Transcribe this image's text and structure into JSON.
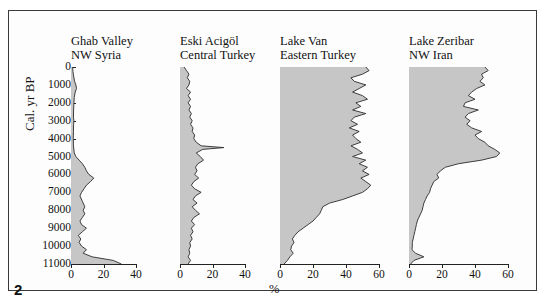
{
  "figure": {
    "number": "2",
    "yaxis_label": "Cal. yr BP",
    "xaxis_label": "%"
  },
  "chart_data": {
    "type": "area",
    "title": "",
    "xlabel": "%",
    "ylabel": "Cal. yr BP",
    "ylim": [
      0,
      11000
    ],
    "y_inverted": true,
    "grid": false,
    "legend": "none",
    "y_ticks": [
      0,
      1000,
      2000,
      3000,
      4000,
      5000,
      6000,
      7000,
      8000,
      9000,
      10000,
      11000
    ],
    "panels": [
      {
        "name": "Ghab Valley",
        "title_line1": "Ghab Valley",
        "title_line2": "NW Syria",
        "xlim": [
          0,
          40
        ],
        "x_ticks": [
          0,
          20,
          40
        ],
        "x_tick_labels": [
          "0",
          "20",
          "40"
        ],
        "y": [
          0,
          250,
          500,
          800,
          1000,
          1200,
          1400,
          1700,
          2000,
          2400,
          2800,
          3000,
          3200,
          3600,
          4000,
          4400,
          4800,
          5000,
          5200,
          5400,
          5600,
          5800,
          6000,
          6200,
          6400,
          6600,
          6800,
          7000,
          7200,
          7500,
          7800,
          8000,
          8200,
          8400,
          8600,
          8800,
          9000,
          9200,
          9400,
          9600,
          9800,
          10000,
          10200,
          10400,
          10600,
          10800,
          11000
        ],
        "values": [
          1.0,
          1.2,
          1.6,
          2.2,
          3.0,
          3.4,
          2.6,
          2.0,
          1.8,
          1.6,
          1.5,
          1.8,
          1.6,
          1.5,
          1.4,
          1.5,
          2.0,
          3.0,
          5.0,
          7.0,
          8.5,
          9.5,
          11.0,
          14.0,
          12.0,
          9.5,
          8.0,
          6.5,
          5.5,
          7.0,
          8.5,
          7.5,
          8.5,
          7.0,
          5.5,
          6.5,
          9.5,
          7.0,
          4.5,
          6.0,
          5.0,
          6.5,
          9.5,
          7.5,
          13.0,
          26.0,
          31.0
        ]
      },
      {
        "name": "Eski Acigöl",
        "title_line1": "Eski Acigöl",
        "title_line2": "Central Turkey",
        "xlim": [
          0,
          40
        ],
        "x_ticks": [
          0,
          20,
          40
        ],
        "x_tick_labels": [
          "0",
          "20",
          "40"
        ],
        "y": [
          0,
          200,
          400,
          600,
          800,
          1000,
          1200,
          1400,
          1600,
          1800,
          2000,
          2200,
          2400,
          2600,
          2800,
          3000,
          3200,
          3400,
          3600,
          3800,
          4000,
          4200,
          4400,
          4500,
          4600,
          4800,
          5000,
          5200,
          5400,
          5600,
          5800,
          6000,
          6200,
          6400,
          6600,
          6800,
          7000,
          7200,
          7400,
          7600,
          7800,
          8000,
          8200,
          8400,
          8600,
          8800,
          9000,
          9200,
          9400,
          9600,
          9800,
          10000,
          10200,
          10400,
          10600,
          10800,
          11000
        ],
        "values": [
          2.5,
          4.0,
          5.5,
          4.5,
          6.0,
          5.5,
          4.0,
          6.5,
          5.0,
          6.5,
          5.0,
          6.5,
          5.5,
          7.0,
          6.0,
          7.5,
          6.5,
          8.0,
          7.5,
          9.0,
          8.5,
          10.0,
          13.0,
          27.0,
          14.0,
          10.0,
          12.5,
          14.5,
          11.0,
          9.5,
          10.5,
          9.0,
          11.5,
          8.5,
          7.0,
          9.0,
          13.0,
          9.5,
          8.0,
          10.5,
          7.5,
          9.5,
          12.0,
          8.5,
          7.0,
          9.0,
          7.0,
          8.0,
          6.5,
          7.5,
          6.0,
          6.5,
          5.5,
          6.0,
          5.0,
          6.5,
          5.0
        ]
      },
      {
        "name": "Lake Van",
        "title_line1": "Lake Van",
        "title_line2": "Eastern Turkey",
        "xlim": [
          0,
          60
        ],
        "x_ticks": [
          0,
          20,
          40,
          60
        ],
        "x_tick_labels": [
          "0",
          "20",
          "40",
          "60"
        ],
        "y": [
          0,
          200,
          400,
          600,
          800,
          1000,
          1200,
          1400,
          1600,
          1800,
          2000,
          2200,
          2400,
          2600,
          2800,
          3000,
          3200,
          3400,
          3600,
          3800,
          4000,
          4200,
          4400,
          4600,
          4800,
          5000,
          5200,
          5400,
          5600,
          5800,
          6000,
          6200,
          6400,
          6600,
          6800,
          7000,
          7200,
          7400,
          7600,
          7800,
          8000,
          8200,
          8400,
          8600,
          8800,
          9000,
          9200,
          9400,
          9600,
          9800,
          10000,
          10200,
          10400,
          10600,
          10800,
          11000
        ],
        "values": [
          52.0,
          54.0,
          50.0,
          43.0,
          45.0,
          52.0,
          48.0,
          44.0,
          50.0,
          53.0,
          46.0,
          49.0,
          44.0,
          52.0,
          45.0,
          43.0,
          47.0,
          42.0,
          48.0,
          44.0,
          46.0,
          49.0,
          43.0,
          47.0,
          50.0,
          44.0,
          52.0,
          48.0,
          53.0,
          50.0,
          54.0,
          49.0,
          52.0,
          55.0,
          53.0,
          50.0,
          44.0,
          38.0,
          30.0,
          26.0,
          25.0,
          24.0,
          22.0,
          20.0,
          17.0,
          14.0,
          11.0,
          9.0,
          7.5,
          8.5,
          7.0,
          6.5,
          8.0,
          6.0,
          4.5,
          2.5
        ]
      },
      {
        "name": "Lake Zeribar",
        "title_line1": "Lake Zeribar",
        "title_line2": "NW Iran",
        "xlim": [
          0,
          60
        ],
        "x_ticks": [
          0,
          20,
          40,
          60
        ],
        "x_tick_labels": [
          "0",
          "20",
          "40",
          "60"
        ],
        "y": [
          0,
          200,
          400,
          600,
          800,
          1000,
          1200,
          1400,
          1600,
          1800,
          2000,
          2200,
          2400,
          2600,
          2800,
          3000,
          3200,
          3400,
          3600,
          3800,
          4000,
          4200,
          4400,
          4600,
          4800,
          5000,
          5200,
          5400,
          5600,
          5800,
          6000,
          6200,
          6400,
          6600,
          6800,
          7000,
          7200,
          7400,
          7600,
          7800,
          8000,
          8200,
          8400,
          8600,
          8800,
          9000,
          9200,
          9400,
          9600,
          9800,
          10000,
          10200,
          10400,
          10600,
          10800,
          11000
        ],
        "values": [
          46.0,
          48.0,
          44.0,
          45.0,
          43.0,
          46.0,
          41.0,
          38.0,
          36.0,
          40.0,
          34.0,
          33.0,
          42.0,
          36.0,
          34.0,
          37.0,
          35.0,
          38.0,
          44.0,
          40.0,
          42.0,
          46.0,
          48.0,
          52.0,
          55.0,
          53.0,
          44.0,
          30.0,
          22.0,
          19.0,
          17.0,
          18.0,
          15.0,
          14.0,
          13.0,
          12.5,
          11.0,
          10.0,
          9.0,
          8.5,
          8.0,
          7.0,
          6.0,
          5.0,
          4.5,
          4.0,
          3.5,
          3.0,
          2.5,
          2.0,
          2.0,
          1.8,
          4.0,
          9.0,
          3.0,
          1.0
        ]
      }
    ]
  }
}
